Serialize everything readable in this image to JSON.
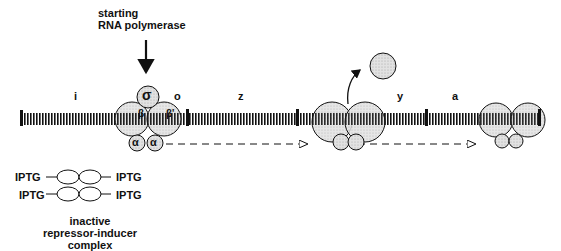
{
  "title": {
    "line1": "starting",
    "line2": "RNA polymerase"
  },
  "genes": [
    {
      "label": "i",
      "x": 75
    },
    {
      "label": "o",
      "x": 176
    },
    {
      "label": "z",
      "x": 240
    },
    {
      "label": "y",
      "x": 399
    },
    {
      "label": "a",
      "x": 454
    }
  ],
  "polymerase_subunits": {
    "sigma": "σ",
    "beta": "β",
    "beta_prime": "β'",
    "alpha1": "α",
    "alpha2": "α"
  },
  "repressor_complex": {
    "inducer_left_top": "IPTG",
    "inducer_left_bottom": "IPTG",
    "inducer_right_top": "IPTG",
    "inducer_right_bottom": "IPTG",
    "caption_line1": "inactive",
    "caption_line2": "repressor-inducer",
    "caption_line3": "complex"
  },
  "colors": {
    "ink": "#111111",
    "subunit_fill": "#d9d9d9",
    "background": "#ffffff"
  }
}
